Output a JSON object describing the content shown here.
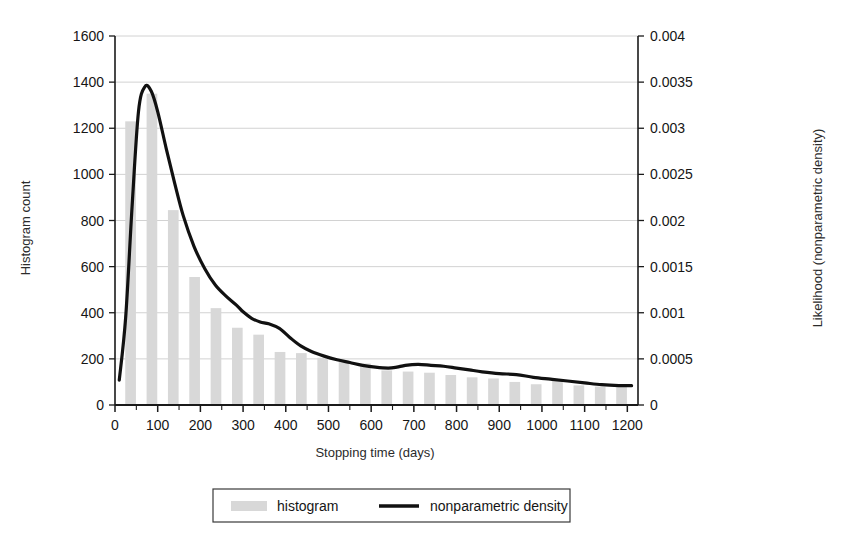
{
  "chart_data": {
    "type": "bar",
    "title": "",
    "subtitle": "",
    "xlabel": "Stopping time (days)",
    "ylabel": "Histogram count",
    "y2label": "Likelihood (nonparametric density)",
    "xlim": [
      0,
      1225
    ],
    "ylim": [
      0,
      1600
    ],
    "y2lim": [
      0,
      0.004
    ],
    "grid": true,
    "grid_axis": "y",
    "legend_position": "bottom-center",
    "x_ticks": [
      0,
      100,
      200,
      300,
      400,
      500,
      600,
      700,
      800,
      900,
      1000,
      1100,
      1200
    ],
    "x_tick_labels": [
      "0",
      "100",
      "200",
      "300",
      "400",
      "500",
      "600",
      "700",
      "800",
      "900",
      "1000",
      "1100",
      "1200"
    ],
    "x_minor_tick_step": 50,
    "y_ticks": [
      0,
      200,
      400,
      600,
      800,
      1000,
      1200,
      1400,
      1600
    ],
    "y_tick_labels": [
      "0",
      "200",
      "400",
      "600",
      "800",
      "1000",
      "1200",
      "1400",
      "1600"
    ],
    "y2_ticks": [
      0,
      0.0005,
      0.001,
      0.0015,
      0.002,
      0.0025,
      0.003,
      0.0035,
      0.004
    ],
    "y2_tick_labels": [
      "0",
      "0.0005",
      "0.001",
      "0.0015",
      "0.002",
      "0.0025",
      "0.003",
      "0.0035",
      "0.004"
    ],
    "bar_color": "#d8d8d8",
    "line_color": "#111111",
    "bin_width": 50,
    "series": [
      {
        "name": "histogram",
        "type": "bar",
        "axis": "left",
        "color": "#d8d8d8",
        "bin_centers": [
          50,
          100,
          150,
          200,
          250,
          300,
          350,
          400,
          450,
          500,
          550,
          600,
          650,
          700,
          750,
          800,
          850,
          900,
          950,
          1000,
          1050,
          1100,
          1150,
          1200
        ],
        "values": [
          1230,
          1350,
          845,
          555,
          420,
          335,
          305,
          230,
          225,
          205,
          190,
          180,
          150,
          145,
          140,
          130,
          120,
          115,
          100,
          90,
          110,
          85,
          80,
          78
        ]
      },
      {
        "name": "nonparametric density",
        "type": "line",
        "axis": "right",
        "color": "#111111",
        "x": [
          10,
          25,
          40,
          55,
          70,
          85,
          100,
          120,
          140,
          160,
          185,
          210,
          235,
          260,
          285,
          300,
          320,
          340,
          360,
          385,
          410,
          435,
          460,
          490,
          520,
          550,
          580,
          610,
          640,
          660,
          680,
          710,
          740,
          770,
          800,
          830,
          860,
          900,
          940,
          980,
          1020,
          1060,
          1100,
          1140,
          1180,
          1210
        ],
        "y": [
          0.00027,
          0.00095,
          0.00215,
          0.00318,
          0.00345,
          0.0034,
          0.00318,
          0.00278,
          0.0024,
          0.00205,
          0.00172,
          0.00148,
          0.0013,
          0.00118,
          0.00108,
          0.00101,
          0.00094,
          0.0009,
          0.00088,
          0.00083,
          0.00073,
          0.00064,
          0.00058,
          0.00053,
          0.00049,
          0.00046,
          0.00043,
          0.00041,
          0.0004,
          0.00041,
          0.00043,
          0.00044,
          0.00043,
          0.00042,
          0.0004,
          0.00038,
          0.00036,
          0.00034,
          0.00033,
          0.0003,
          0.00028,
          0.00026,
          0.00024,
          0.00022,
          0.00021,
          0.00021
        ]
      }
    ]
  },
  "legend": {
    "items": [
      {
        "label": "histogram",
        "marker": "swatch",
        "color": "#d8d8d8"
      },
      {
        "label": "nonparametric density",
        "marker": "line",
        "color": "#111111"
      }
    ]
  }
}
